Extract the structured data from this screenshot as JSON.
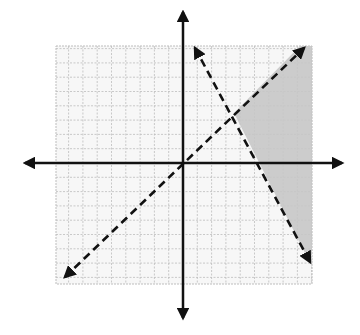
{
  "colors": {
    "background": "#ffffff",
    "grid_line": "#bdbdbd",
    "grid_fill": "#f7f7f7",
    "axis": "#111111",
    "boundary_line": "#111111",
    "shading": "#c6c6c6"
  },
  "plane": {
    "origin_px": [
      183,
      163
    ],
    "unit_px": 14.3,
    "grid_bounds_px": {
      "left": 56,
      "right": 312,
      "top": 46,
      "bottom": 284
    },
    "x_range_units": [
      -9,
      9
    ],
    "y_range_units": [
      -8.5,
      8.2
    ],
    "x_axis": {
      "from_px": [
        25,
        163
      ],
      "to_px": [
        342,
        163
      ],
      "arrows": "both"
    },
    "y_axis": {
      "from_px": [
        183,
        12
      ],
      "to_px": [
        183,
        318
      ],
      "arrows": "both"
    }
  },
  "boundaries": [
    {
      "name": "increasing-dashed-line",
      "style": "dashed",
      "equation_approx": "y = x",
      "from_px": [
        65,
        277
      ],
      "to_px": [
        304,
        48
      ]
    },
    {
      "name": "decreasing-dashed-line",
      "style": "dashed",
      "equation_approx": "y = -1.85x + 10",
      "from_px": [
        195,
        48
      ],
      "to_px": [
        310,
        262
      ]
    }
  ],
  "intersection_px": [
    234,
    113
  ],
  "intersection_units_approx": [
    3.5,
    3.5
  ],
  "shaded_region": {
    "description": "Region below y = x and to the right of the decreasing line",
    "polygon_px": [
      [
        234,
        113
      ],
      [
        300,
        46
      ],
      [
        312,
        46
      ],
      [
        312,
        255
      ],
      [
        306,
        255
      ]
    ]
  }
}
